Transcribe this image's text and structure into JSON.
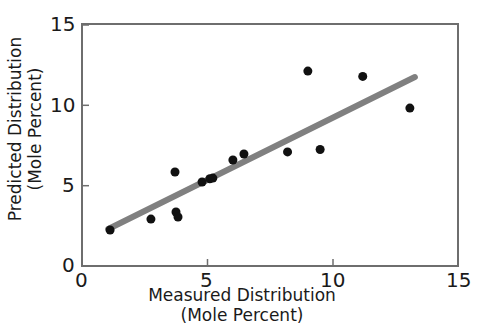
{
  "chart_data": {
    "type": "scatter",
    "title": "",
    "xlabel": "Measured Distribution (Mole Percent)",
    "ylabel": "Predicted Distribution (Mole Percent)",
    "xlabel_line1": "Measured Distribution",
    "xlabel_line2": "(Mole Percent)",
    "ylabel_line1": "Predicted Distribution",
    "ylabel_line2": "(Mole Percent)",
    "xlim": [
      0,
      15
    ],
    "ylim": [
      0,
      15
    ],
    "xticks": [
      0,
      5,
      10,
      15
    ],
    "yticks": [
      0,
      5,
      10,
      15
    ],
    "xtick_labels": [
      "0",
      "5",
      "10",
      "15"
    ],
    "ytick_labels": [
      "0",
      "5",
      "10",
      "15"
    ],
    "grid": false,
    "legend": null,
    "marker_color": "#111111",
    "marker_size": 9,
    "trendline_color": "#808080",
    "points": [
      {
        "x": 1.12,
        "y": 2.24
      },
      {
        "x": 2.75,
        "y": 2.92
      },
      {
        "x": 3.71,
        "y": 5.85
      },
      {
        "x": 3.75,
        "y": 3.36
      },
      {
        "x": 3.83,
        "y": 3.05
      },
      {
        "x": 4.79,
        "y": 5.23
      },
      {
        "x": 5.1,
        "y": 5.43
      },
      {
        "x": 5.22,
        "y": 5.47
      },
      {
        "x": 6.02,
        "y": 6.6
      },
      {
        "x": 6.46,
        "y": 6.97
      },
      {
        "x": 8.2,
        "y": 7.1
      },
      {
        "x": 9.01,
        "y": 12.13
      },
      {
        "x": 9.5,
        "y": 7.25
      },
      {
        "x": 11.2,
        "y": 11.8
      },
      {
        "x": 13.08,
        "y": 9.83
      }
    ],
    "trendline": {
      "x_start": 1.05,
      "y_start": 2.3,
      "x_end": 13.28,
      "y_end": 11.76
    }
  },
  "axes": {
    "x_tick_0": "0",
    "x_tick_5": "5",
    "x_tick_10": "10",
    "x_tick_15": "15",
    "y_tick_0": "0",
    "y_tick_5": "5",
    "y_tick_10": "10",
    "y_tick_15": "15"
  }
}
